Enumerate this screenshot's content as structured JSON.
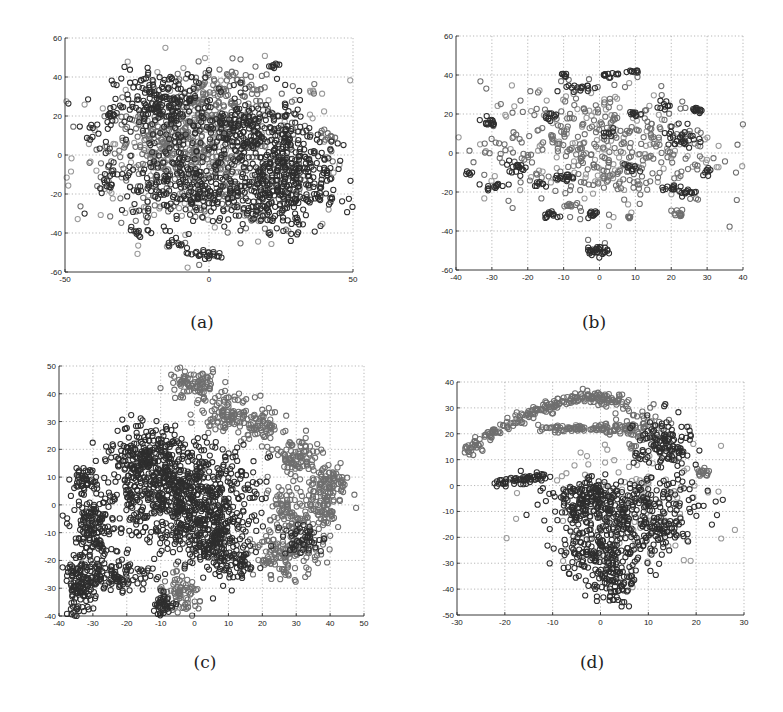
{
  "figure": {
    "panels": [
      {
        "id": "a",
        "caption": "(a)"
      },
      {
        "id": "b",
        "caption": "(b)"
      },
      {
        "id": "c",
        "caption": "(c)"
      },
      {
        "id": "d",
        "caption": "(d)"
      }
    ]
  },
  "colors": {
    "dark": "#2e2e2e",
    "mid": "#6f6f6f",
    "light": "#9a9a9a",
    "axis": "#222222",
    "grid": "#9a9a9a"
  },
  "chart_data": [
    {
      "panel": "a",
      "type": "scatter",
      "title": "",
      "xlabel": "",
      "ylabel": "",
      "caption": "(a)",
      "xlim": [
        -50,
        50
      ],
      "ylim": [
        -60,
        60
      ],
      "xticks": [
        -50,
        0,
        50
      ],
      "yticks": [
        -60,
        -40,
        -20,
        0,
        20,
        40,
        60
      ],
      "grid": true,
      "legend": null,
      "marker": "hollow circle",
      "box": {
        "x": 65,
        "y": 38,
        "w": 288,
        "h": 234
      },
      "description": "Dense roughly circular cloud of overlapping classes, centered near (0,0), radius ~40; outlying small clusters around perimeter and bottom near (0,-50).",
      "clusters": [
        {
          "cx": -15,
          "cy": 25,
          "sx": 9,
          "sy": 9,
          "n": 220,
          "tone": "dark"
        },
        {
          "cx": 15,
          "cy": 10,
          "sx": 10,
          "sy": 10,
          "n": 240,
          "tone": "dark"
        },
        {
          "cx": 20,
          "cy": -20,
          "sx": 10,
          "sy": 9,
          "n": 230,
          "tone": "dark"
        },
        {
          "cx": -10,
          "cy": -15,
          "sx": 10,
          "sy": 10,
          "n": 200,
          "tone": "dark"
        },
        {
          "cx": -15,
          "cy": 5,
          "sx": 10,
          "sy": 10,
          "n": 160,
          "tone": "mid"
        },
        {
          "cx": 5,
          "cy": 30,
          "sx": 10,
          "sy": 8,
          "n": 140,
          "tone": "mid"
        },
        {
          "cx": 0,
          "cy": -5,
          "sx": 18,
          "sy": 18,
          "n": 300,
          "tone": "mid"
        },
        {
          "cx": 30,
          "cy": -5,
          "sx": 7,
          "sy": 10,
          "n": 140,
          "tone": "dark"
        },
        {
          "cx": 0,
          "cy": 0,
          "sx": 24,
          "sy": 22,
          "n": 260,
          "tone": "light"
        },
        {
          "cx": -2,
          "cy": -51,
          "sx": 4,
          "sy": 1.5,
          "n": 25,
          "tone": "dark"
        },
        {
          "cx": -34,
          "cy": 20,
          "sx": 1.5,
          "sy": 3,
          "n": 14,
          "tone": "dark"
        },
        {
          "cx": -35,
          "cy": -10,
          "sx": 1.5,
          "sy": 4,
          "n": 16,
          "tone": "dark"
        },
        {
          "cx": -24,
          "cy": -40,
          "sx": 1.5,
          "sy": 2,
          "n": 10,
          "tone": "dark"
        },
        {
          "cx": 22,
          "cy": 46,
          "sx": 1.5,
          "sy": 1,
          "n": 8,
          "tone": "dark"
        },
        {
          "cx": 42,
          "cy": 10,
          "sx": 3,
          "sy": 1.5,
          "n": 10,
          "tone": "mid"
        },
        {
          "cx": 30,
          "cy": -35,
          "sx": 1.5,
          "sy": 3,
          "n": 12,
          "tone": "dark"
        },
        {
          "cx": -40,
          "cy": 10,
          "sx": 2,
          "sy": 3,
          "n": 10,
          "tone": "dark"
        },
        {
          "cx": -12,
          "cy": -45,
          "sx": 2,
          "sy": 1.5,
          "n": 10,
          "tone": "dark"
        },
        {
          "cx": 40,
          "cy": -22,
          "sx": 2,
          "sy": 1.5,
          "n": 10,
          "tone": "dark"
        }
      ]
    },
    {
      "panel": "b",
      "type": "scatter",
      "title": "",
      "xlabel": "",
      "ylabel": "",
      "caption": "(b)",
      "xlim": [
        -40,
        40
      ],
      "ylim": [
        -60,
        60
      ],
      "xticks": [
        -40,
        -30,
        -20,
        -10,
        0,
        10,
        20,
        30,
        40
      ],
      "yticks": [
        -60,
        -40,
        -20,
        0,
        20,
        40,
        60
      ],
      "grid": true,
      "legend": null,
      "marker": "hollow circle",
      "box": {
        "x": 456,
        "y": 36,
        "w": 287,
        "h": 234
      },
      "description": "Sparse cloud of many small tight clusters spread over x in [-37,36], y in [-35,42]; isolated tight cluster at (0,-50).",
      "clusters": [
        {
          "cx": 0,
          "cy": 3,
          "sx": 16,
          "sy": 16,
          "n": 330,
          "tone": "mid"
        },
        {
          "cx": 0,
          "cy": 3,
          "sx": 16,
          "sy": 16,
          "n": 150,
          "tone": "light"
        },
        {
          "cx": -1,
          "cy": -50,
          "sx": 1.5,
          "sy": 1.2,
          "n": 30,
          "tone": "dark"
        },
        {
          "cx": -31,
          "cy": 16,
          "sx": 1,
          "sy": 1.2,
          "n": 14,
          "tone": "dark"
        },
        {
          "cx": -29,
          "cy": -17,
          "sx": 1.5,
          "sy": 1,
          "n": 14,
          "tone": "dark"
        },
        {
          "cx": -37,
          "cy": -10,
          "sx": 0.6,
          "sy": 0.6,
          "n": 6,
          "tone": "dark"
        },
        {
          "cx": -10,
          "cy": 40,
          "sx": 0.6,
          "sy": 0.6,
          "n": 6,
          "tone": "dark"
        },
        {
          "cx": 3,
          "cy": 40,
          "sx": 1.5,
          "sy": 0.7,
          "n": 12,
          "tone": "dark"
        },
        {
          "cx": 9,
          "cy": 42,
          "sx": 1,
          "sy": 0.5,
          "n": 8,
          "tone": "dark"
        },
        {
          "cx": 27,
          "cy": 22,
          "sx": 1,
          "sy": 1,
          "n": 12,
          "tone": "dark"
        },
        {
          "cx": 23,
          "cy": 8,
          "sx": 2,
          "sy": 4,
          "n": 30,
          "tone": "dark"
        },
        {
          "cx": -13,
          "cy": -32,
          "sx": 1.5,
          "sy": 1,
          "n": 14,
          "tone": "dark"
        },
        {
          "cx": -2,
          "cy": -31,
          "sx": 1,
          "sy": 1,
          "n": 12,
          "tone": "dark"
        },
        {
          "cx": 22,
          "cy": -31,
          "sx": 1,
          "sy": 1,
          "n": 12,
          "tone": "mid"
        },
        {
          "cx": -8,
          "cy": -27,
          "sx": 1,
          "sy": 0.7,
          "n": 8,
          "tone": "mid"
        },
        {
          "cx": 8,
          "cy": -33,
          "sx": 0.7,
          "sy": 0.7,
          "n": 6,
          "tone": "mid"
        },
        {
          "cx": -23,
          "cy": -7,
          "sx": 1.5,
          "sy": 1.5,
          "n": 16,
          "tone": "dark"
        },
        {
          "cx": -10,
          "cy": -13,
          "sx": 1.5,
          "sy": 1,
          "n": 14,
          "tone": "dark"
        },
        {
          "cx": 9,
          "cy": -8,
          "sx": 1,
          "sy": 1,
          "n": 10,
          "tone": "dark"
        },
        {
          "cx": 10,
          "cy": 20,
          "sx": 1,
          "sy": 1,
          "n": 10,
          "tone": "dark"
        },
        {
          "cx": -6,
          "cy": 33,
          "sx": 2,
          "sy": 1.5,
          "n": 16,
          "tone": "dark"
        },
        {
          "cx": 18,
          "cy": 24,
          "sx": 1,
          "sy": 1.5,
          "n": 10,
          "tone": "dark"
        },
        {
          "cx": 20,
          "cy": -18,
          "sx": 1.5,
          "sy": 1,
          "n": 12,
          "tone": "dark"
        },
        {
          "cx": 25,
          "cy": -20,
          "sx": 1.5,
          "sy": 1,
          "n": 12,
          "tone": "dark"
        },
        {
          "cx": 30,
          "cy": -9,
          "sx": 0.8,
          "sy": 1,
          "n": 8,
          "tone": "dark"
        },
        {
          "cx": -13,
          "cy": 19,
          "sx": 1,
          "sy": 1,
          "n": 10,
          "tone": "dark"
        },
        {
          "cx": 3,
          "cy": 10,
          "sx": 1,
          "sy": 1,
          "n": 8,
          "tone": "dark"
        },
        {
          "cx": -16,
          "cy": -16,
          "sx": 1,
          "sy": 1,
          "n": 8,
          "tone": "dark"
        }
      ]
    },
    {
      "panel": "c",
      "type": "scatter",
      "title": "",
      "xlabel": "",
      "ylabel": "",
      "caption": "(c)",
      "xlim": [
        -40,
        50
      ],
      "ylim": [
        -40,
        50
      ],
      "xticks": [
        -40,
        -30,
        -20,
        -10,
        0,
        10,
        20,
        30,
        40,
        50
      ],
      "yticks": [
        -40,
        -30,
        -20,
        -10,
        0,
        10,
        20,
        30,
        40,
        50
      ],
      "grid": true,
      "legend": null,
      "marker": "hollow circle",
      "box": {
        "x": 59,
        "y": 366,
        "w": 305,
        "h": 250
      },
      "description": "Large dark connected blob on left (x -35..17, y -40..32); separate gray elongated band top-right from (-6,48) to (25,22); gray hooked structure on right (x 20..46, y -25..22); small gray cluster near (-5,-35).",
      "clusters": [
        {
          "cx": -5,
          "cy": 5,
          "sx": 11,
          "sy": 9,
          "n": 700,
          "tone": "dark"
        },
        {
          "cx": 5,
          "cy": -10,
          "sx": 6,
          "sy": 7,
          "n": 250,
          "tone": "dark"
        },
        {
          "cx": -15,
          "cy": 18,
          "sx": 5,
          "sy": 5,
          "n": 160,
          "tone": "dark"
        },
        {
          "cx": -30,
          "cy": -10,
          "sx": 3,
          "sy": 8,
          "n": 170,
          "tone": "dark"
        },
        {
          "cx": -34,
          "cy": -30,
          "sx": 2.2,
          "sy": 5,
          "n": 120,
          "tone": "dark"
        },
        {
          "cx": -22,
          "cy": -25,
          "sx": 5,
          "sy": 3,
          "n": 100,
          "tone": "dark"
        },
        {
          "cx": -33,
          "cy": 9,
          "sx": 2,
          "sy": 2,
          "n": 40,
          "tone": "dark"
        },
        {
          "cx": 12,
          "cy": -22,
          "sx": 3,
          "sy": 3,
          "n": 60,
          "tone": "dark"
        },
        {
          "cx": -4,
          "cy": -33,
          "sx": 3.5,
          "sy": 3.5,
          "n": 80,
          "tone": "mid"
        },
        {
          "cx": -9,
          "cy": -36,
          "sx": 2,
          "sy": 2,
          "n": 40,
          "tone": "dark"
        },
        {
          "cx": 0,
          "cy": 43,
          "sx": 4,
          "sy": 3,
          "n": 90,
          "tone": "mid"
        },
        {
          "cx": 10,
          "cy": 33,
          "sx": 4,
          "sy": 3,
          "n": 100,
          "tone": "mid"
        },
        {
          "cx": 20,
          "cy": 28,
          "sx": 3,
          "sy": 3,
          "n": 60,
          "tone": "mid"
        },
        {
          "cx": 30,
          "cy": 17,
          "sx": 3.5,
          "sy": 3.5,
          "n": 90,
          "tone": "mid"
        },
        {
          "cx": 40,
          "cy": 8,
          "sx": 3,
          "sy": 3,
          "n": 80,
          "tone": "mid"
        },
        {
          "cx": 37,
          "cy": -2,
          "sx": 3,
          "sy": 5,
          "n": 90,
          "tone": "mid"
        },
        {
          "cx": 27,
          "cy": -3,
          "sx": 2.5,
          "sy": 6,
          "n": 80,
          "tone": "mid"
        },
        {
          "cx": 27,
          "cy": -18,
          "sx": 5,
          "sy": 4,
          "n": 140,
          "tone": "mid"
        },
        {
          "cx": 32,
          "cy": -12,
          "sx": 3,
          "sy": 3,
          "n": 50,
          "tone": "dark"
        }
      ]
    },
    {
      "panel": "d",
      "type": "scatter",
      "title": "",
      "xlabel": "",
      "ylabel": "",
      "caption": "(d)",
      "xlim": [
        -30,
        30
      ],
      "ylim": [
        -50,
        40
      ],
      "xticks": [
        -30,
        -20,
        -10,
        0,
        10,
        20,
        30
      ],
      "yticks": [
        -50,
        -40,
        -30,
        -20,
        -10,
        0,
        10,
        20,
        30,
        40
      ],
      "grid": true,
      "legend": null,
      "marker": "hollow circle",
      "box": {
        "x": 457,
        "y": 382,
        "w": 287,
        "h": 233
      },
      "description": "Arc of gray points from (-28,13) up through (-10,34) to (10,30) curving down into a dense dark region (x -10..18, y -45..20); inner horizontal band y~22 from x -13 to 7; short dark streak y~0 from x -22 to -11; small cluster at (21,5).",
      "arcs": [
        {
          "from_x": -28,
          "to_x": 5,
          "curve": "upper",
          "n": 220,
          "tone": "mid"
        },
        {
          "from_x": -13,
          "to_x": 7,
          "y": 22,
          "n": 90,
          "tone": "mid"
        },
        {
          "from_x": -22,
          "to_x": -11,
          "y": 1,
          "n": 60,
          "tone": "dark"
        }
      ],
      "clusters": [
        {
          "cx": 13,
          "cy": 15,
          "sx": 3,
          "sy": 6,
          "n": 130,
          "tone": "dark"
        },
        {
          "cx": 8,
          "cy": 22,
          "sx": 3,
          "sy": 4,
          "n": 60,
          "tone": "mid"
        },
        {
          "cx": 5,
          "cy": -8,
          "sx": 8,
          "sy": 5,
          "n": 280,
          "tone": "dark"
        },
        {
          "cx": 1,
          "cy": -25,
          "sx": 5,
          "sy": 6,
          "n": 200,
          "tone": "dark"
        },
        {
          "cx": 2,
          "cy": -38,
          "sx": 2.5,
          "sy": 4,
          "n": 70,
          "tone": "dark"
        },
        {
          "cx": -4,
          "cy": -5,
          "sx": 3,
          "sy": 4,
          "n": 80,
          "tone": "dark"
        },
        {
          "cx": 12,
          "cy": -18,
          "sx": 3,
          "sy": 3,
          "n": 60,
          "tone": "dark"
        },
        {
          "cx": 21,
          "cy": 5,
          "sx": 1,
          "sy": 1,
          "n": 14,
          "tone": "mid"
        },
        {
          "cx": 6,
          "cy": -5,
          "sx": 10,
          "sy": 12,
          "n": 120,
          "tone": "light"
        }
      ]
    }
  ]
}
